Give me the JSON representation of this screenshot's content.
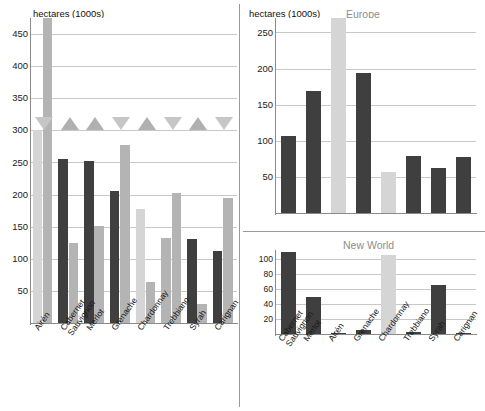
{
  "figure": {
    "axis_title": "hectares (1000s)",
    "colors": {
      "dark_bar": "#3f3f3f",
      "light_bar": "#b4b4b4",
      "pale_bar": "#d5d5d5",
      "grid": "#c8c8c8",
      "axis": "#8a8a8a",
      "title_gray": "#8d8d8d",
      "triangle_up": "#b0b0b0",
      "triangle_down": "#c6c6c6"
    }
  },
  "chart_data": [
    {
      "type": "bar",
      "panel": "world",
      "title": "",
      "axis_title": "hectares (1000s)",
      "xlabel": "",
      "ylabel": "hectares (1000s)",
      "ylim": [
        0,
        475
      ],
      "yticks": [
        50,
        100,
        150,
        200,
        250,
        300,
        350,
        400,
        450
      ],
      "grid": true,
      "legend": "none",
      "categories": [
        "Airén",
        "Cabernet Sauvignon",
        "Merlot",
        "Grenache",
        "Chardonnay",
        "Trebbiano",
        "Syrah",
        "Carignan"
      ],
      "category_lines": [
        [
          "Airén"
        ],
        [
          "Cabernet",
          "Sauvignon"
        ],
        [
          "Merlot"
        ],
        [
          "Grenache"
        ],
        [
          "Chardonnay"
        ],
        [
          "Trebbiano"
        ],
        [
          "Syrah"
        ],
        [
          "Carignan"
        ]
      ],
      "series": [
        {
          "name": "bar-a",
          "color": "#b9b9b9",
          "values": [
            300,
            256,
            252,
            205,
            177,
            132,
            131,
            112
          ],
          "style": [
            "pale",
            "dark",
            "dark",
            "dark",
            "pale",
            "light",
            "dark",
            "dark"
          ]
        },
        {
          "name": "bar-b",
          "color": "#aeaeae",
          "values": [
            478,
            125,
            151,
            277,
            64,
            202,
            30,
            195
          ],
          "style": [
            "light",
            "light",
            "light",
            "light",
            "light",
            "light",
            "light",
            "light"
          ],
          "clipped": [
            true,
            false,
            false,
            false,
            false,
            false,
            false,
            false
          ]
        }
      ],
      "markers": {
        "name": "trend-triangles",
        "directions": [
          "down",
          "up",
          "up",
          "down",
          "up",
          "down",
          "up",
          "down"
        ],
        "baseline_value": 300
      }
    },
    {
      "type": "bar",
      "panel": "europe",
      "title": "Europe",
      "axis_title": "hectares (1000s)",
      "xlabel": "",
      "ylabel": "hectares (1000s)",
      "ylim": [
        0,
        270
      ],
      "yticks": [
        50,
        100,
        150,
        200,
        250
      ],
      "grid": true,
      "legend": "none",
      "categories": [
        "Cabernet Sauvignon",
        "Merlot",
        "Airén",
        "Grenache",
        "Chardonnay",
        "Trebbiano",
        "Syrah",
        "Carignan"
      ],
      "values": [
        106,
        169,
        292,
        194,
        57,
        79,
        63,
        78
      ],
      "styles": [
        "dark",
        "dark",
        "pale",
        "dark",
        "pale",
        "dark",
        "dark",
        "dark"
      ],
      "clipped": [
        false,
        false,
        true,
        false,
        false,
        false,
        false,
        false
      ]
    },
    {
      "type": "bar",
      "panel": "new_world",
      "title": "New World",
      "axis_title": "",
      "xlabel": "",
      "ylabel": "",
      "ylim": [
        0,
        112
      ],
      "yticks": [
        20,
        40,
        60,
        80,
        100
      ],
      "grid": true,
      "legend": "none",
      "categories": [
        "Cabernet Sauvignon",
        "Merlot",
        "Airén",
        "Grenache",
        "Chardonnay",
        "Trebbiano",
        "Syrah",
        "Carignan"
      ],
      "category_lines": [
        [
          "Cabernet",
          "Sauvignon"
        ],
        [
          "Merlot"
        ],
        [
          "Airén"
        ],
        [
          "Grenache"
        ],
        [
          "Chardonnay"
        ],
        [
          "Trebbiano"
        ],
        [
          "Syrah"
        ],
        [
          "Carignan"
        ]
      ],
      "values": [
        110,
        50,
        0.5,
        6,
        106,
        3,
        66,
        1
      ],
      "styles": [
        "dark",
        "dark",
        "dark",
        "dark",
        "pale",
        "dark",
        "dark",
        "dark"
      ],
      "clipped": [
        false,
        false,
        false,
        false,
        true,
        false,
        false,
        false
      ]
    }
  ]
}
